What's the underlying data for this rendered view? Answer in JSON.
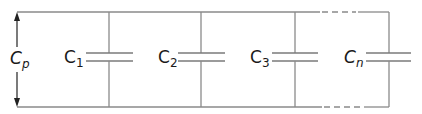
{
  "diagram": {
    "labels": {
      "parasitic": {
        "main": "C",
        "sub": "p"
      },
      "capacitors": [
        {
          "main": "C",
          "sub": "1"
        },
        {
          "main": "C",
          "sub": "2"
        },
        {
          "main": "C",
          "sub": "3"
        },
        {
          "main": "C",
          "sub": "n"
        }
      ]
    },
    "colors": {
      "wire": "#8a8a8a",
      "arrow": "#222222",
      "text": "#1a1a1a"
    }
  }
}
